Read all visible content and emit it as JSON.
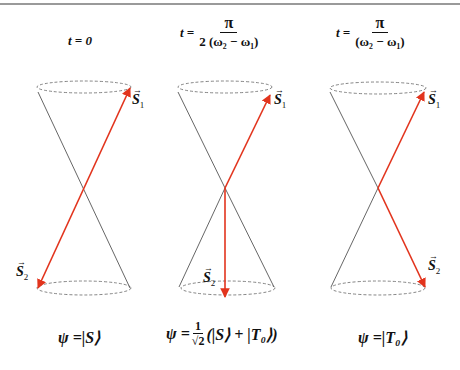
{
  "colors": {
    "vector": "#e2341d",
    "cone": "#555555",
    "ellipse": "#666666",
    "rule": "#9a9a9a"
  },
  "panels": [
    {
      "time": {
        "prefix": "t = 0",
        "numerator": "",
        "denominator": ""
      },
      "vectors": {
        "s1": "S",
        "s1_sub": "1",
        "s2": "S",
        "s2_sub": "2"
      },
      "state": {
        "lhs": "ψ = ",
        "ket": "|S⟩"
      }
    },
    {
      "time": {
        "prefix": "t =",
        "numerator": "π",
        "denominator": "2 (ω₂ − ω₁)"
      },
      "vectors": {
        "s1": "S",
        "s1_sub": "1",
        "s2": "S",
        "s2_sub": "2"
      },
      "state": {
        "lhs": "ψ = ",
        "frac_num": "1",
        "frac_den": "√2",
        "ket": "(|S⟩ + |T₀⟩)"
      }
    },
    {
      "time": {
        "prefix": "t =",
        "numerator": "π",
        "denominator": "(ω₂ − ω₁)"
      },
      "vectors": {
        "s1": "S",
        "s1_sub": "1",
        "s2": "S",
        "s2_sub": "2"
      },
      "state": {
        "lhs": "ψ = ",
        "ket": "|T₀⟩"
      }
    }
  ]
}
